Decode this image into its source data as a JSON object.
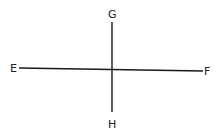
{
  "diagram": {
    "type": "intersecting-lines",
    "stroke_color": "#1a1a1a",
    "background": "#ffffff",
    "labels": {
      "E": "E",
      "F": "F",
      "G": "G",
      "H": "H"
    },
    "lines": [
      {
        "name": "EF",
        "from": "E",
        "to": "F",
        "x1": 19,
        "y1": 68,
        "x2": 203,
        "y2": 71
      },
      {
        "name": "GH",
        "from": "G",
        "to": "H",
        "x1": 112,
        "y1": 22,
        "x2": 112,
        "y2": 112
      }
    ],
    "intersection": {
      "x": 112,
      "y": 70
    }
  }
}
